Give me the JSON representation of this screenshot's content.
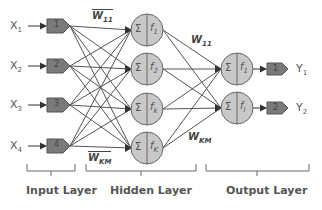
{
  "inputs": [
    {
      "label": "X",
      "sub": "1",
      "node": "1"
    },
    {
      "label": "X",
      "sub": "2",
      "node": "2"
    },
    {
      "label": "X",
      "sub": "3",
      "node": "3"
    },
    {
      "label": "X",
      "sub": "4",
      "node": "4"
    }
  ],
  "hidden": [
    {
      "sum": "Σ",
      "func": "f",
      "sub": "1"
    },
    {
      "sum": "Σ",
      "func": "f",
      "sub": "2"
    },
    {
      "sum": "Σ",
      "func": "f",
      "sub": "k"
    },
    {
      "sum": "Σ",
      "func": "f",
      "sub": "K"
    }
  ],
  "outputs": [
    {
      "sum": "Σ",
      "func": "f",
      "sub": "1",
      "node": "1",
      "label": "Y",
      "label_sub": "1"
    },
    {
      "sum": "Σ",
      "func": "f",
      "sub": "l",
      "node": "2",
      "label": "Y",
      "label_sub": "2"
    }
  ],
  "weights": {
    "input_top": {
      "main": "W",
      "sub": "11"
    },
    "input_bottom": {
      "main": "W",
      "sub": "KM"
    },
    "hidden_top": {
      "main": "W",
      "sub": "11"
    },
    "hidden_bottom": {
      "main": "W",
      "sub": "KM"
    }
  },
  "layers": {
    "input": "Input Layer",
    "hidden": "Hidden Layer",
    "output": "Output Layer"
  },
  "colors": {
    "node_fill": "#c8c8c8",
    "box_fill": "#7a7a7a",
    "line": "#555555"
  }
}
